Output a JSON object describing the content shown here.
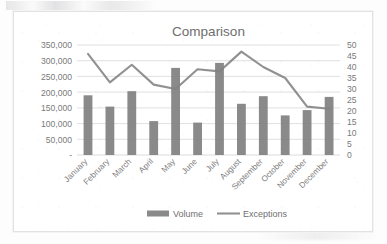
{
  "chart_data": {
    "type": "bar",
    "title": "Comparison",
    "xlabel": "",
    "ylabel": "",
    "grid": true,
    "legend_position": "bottom",
    "categories": [
      "January",
      "February",
      "March",
      "April",
      "May",
      "June",
      "July",
      "August",
      "September",
      "October",
      "November",
      "December"
    ],
    "series": [
      {
        "name": "Volume",
        "type": "bar",
        "axis": "left",
        "color": "#808080",
        "values": [
          190000,
          154000,
          203000,
          108000,
          277000,
          103000,
          293000,
          163000,
          187000,
          126000,
          143000,
          185000
        ]
      },
      {
        "name": "Exceptions",
        "type": "line",
        "axis": "right",
        "color": "#828282",
        "values": [
          46,
          33,
          41,
          32,
          30,
          39,
          38,
          47,
          40,
          35,
          22,
          21
        ]
      }
    ],
    "left_axis": {
      "min": 0,
      "max": 350000,
      "step": 50000,
      "tick_labels": [
        "350,000",
        "300,000",
        "250,000",
        "200,000",
        "150,000",
        "100,000",
        "50,000",
        "-"
      ]
    },
    "right_axis": {
      "min": 0,
      "max": 50,
      "step": 5,
      "tick_labels": [
        "50",
        "45",
        "40",
        "35",
        "30",
        "25",
        "20",
        "15",
        "10",
        "5",
        "0"
      ]
    },
    "legend": [
      {
        "label": "Volume",
        "marker": "bar",
        "color": "#808080"
      },
      {
        "label": "Exceptions",
        "marker": "line",
        "color": "#828282"
      }
    ]
  }
}
